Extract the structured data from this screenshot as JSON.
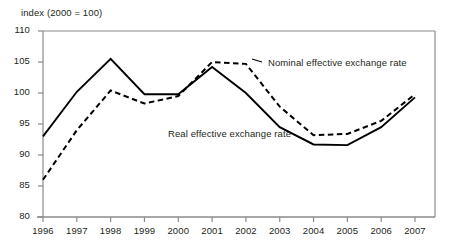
{
  "chart_data": {
    "type": "line",
    "title": "",
    "axis_note": "index (2000 = 100)",
    "xlabel": "",
    "ylabel": "",
    "x": [
      1996,
      1997,
      1998,
      1999,
      2000,
      2001,
      2002,
      2003,
      2004,
      2005,
      2006,
      2007
    ],
    "xtick_labels": [
      "1996",
      "1997",
      "1998",
      "1999",
      "2000",
      "2001",
      "2002",
      "2003",
      "2004",
      "2005",
      "2006",
      "2007"
    ],
    "ytick_labels": [
      "110",
      "105",
      "100",
      "95",
      "90",
      "85",
      "80"
    ],
    "yticks": [
      110,
      105,
      100,
      95,
      90,
      85,
      80
    ],
    "ylim": [
      80,
      110
    ],
    "xlim": [
      1995.6,
      2007.4
    ],
    "grid": false,
    "legend_position": "inline-annotation",
    "series": [
      {
        "name": "Nominal effective exchange rate",
        "style": "dashed",
        "color": "#000000",
        "label_x": 2002.1,
        "label_y": 104.5,
        "values": [
          86.0,
          94.0,
          100.4,
          98.3,
          99.5,
          105.0,
          104.7,
          97.8,
          93.2,
          93.4,
          95.5,
          99.8
        ]
      },
      {
        "name": "Real effective exchange rate",
        "style": "solid",
        "color": "#000000",
        "label_x": 1999.0,
        "label_y": 92.8,
        "values": [
          93.0,
          100.2,
          105.5,
          99.8,
          99.8,
          104.2,
          100.0,
          94.5,
          91.7,
          91.6,
          94.5,
          99.3
        ]
      }
    ]
  },
  "annotations": {
    "nominal_label": "Nominal effective exchange rate",
    "real_label": "Real effective exchange rate"
  }
}
